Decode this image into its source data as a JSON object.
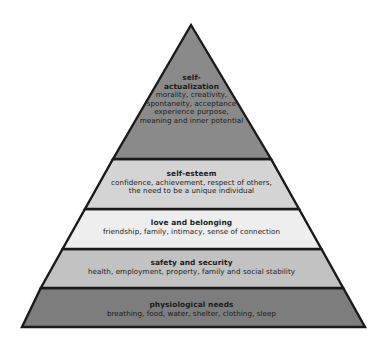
{
  "diagram": {
    "name": "maslow-hierarchy-of-needs-pyramid",
    "shape": "pyramid",
    "background_color": "#ffffff",
    "outline_color": "#1a1a1a",
    "apex": {
      "x": 191,
      "y": 25
    },
    "base_left": {
      "x": 22,
      "y": 327
    },
    "base_right": {
      "x": 365,
      "y": 327
    },
    "tiers": [
      {
        "index": 5,
        "position": "top",
        "title": "self-",
        "title_line2": "actualization",
        "description_lines": [
          "morality, creativity,",
          "spontaneity, acceptance",
          "experience purpose,",
          "meaning and inner potential"
        ],
        "fill_color": "#8a8a8a",
        "y_top": 25,
        "y_bottom": 163
      },
      {
        "index": 4,
        "position": "fourth",
        "title": "self-esteem",
        "description_lines": [
          "confidence, achievement, respect of others,",
          "the need to be a unique individual"
        ],
        "fill_color": "#d4d4d4",
        "y_top": 163,
        "y_bottom": 211
      },
      {
        "index": 3,
        "position": "middle",
        "title": "love and belonging",
        "description_lines": [
          "friendship, family, intimacy, sense of connection"
        ],
        "fill_color": "#eeeeee",
        "y_top": 211,
        "y_bottom": 251
      },
      {
        "index": 2,
        "position": "second",
        "title": "safety and security",
        "description_lines": [
          "health, employment, property, family and social stability"
        ],
        "fill_color": "#c2c2c2",
        "y_top": 251,
        "y_bottom": 290
      },
      {
        "index": 1,
        "position": "base",
        "title": "physiological needs",
        "description_lines": [
          "breathing, food, water, shelter, clothing, sleep"
        ],
        "fill_color": "#7d7d7d",
        "y_top": 290,
        "y_bottom": 327
      }
    ]
  },
  "tier5": {
    "title_line1": "self-",
    "title_line2": "actualization",
    "desc_line1": "morality, creativity,",
    "desc_line2": "spontaneity, acceptance",
    "desc_line3": "experience purpose,",
    "desc_line4": "meaning and inner potential"
  },
  "tier4": {
    "title": "self-esteem",
    "desc_line1": "confidence, achievement, respect of others,",
    "desc_line2": "the need to be a unique individual"
  },
  "tier3": {
    "title": "love and belonging",
    "desc_line1": "friendship, family, intimacy, sense of connection"
  },
  "tier2": {
    "title": "safety and security",
    "desc_line1": "health, employment, property, family and social stability"
  },
  "tier1": {
    "title": "physiological needs",
    "desc_line1": "breathing, food, water, shelter, clothing, sleep"
  }
}
